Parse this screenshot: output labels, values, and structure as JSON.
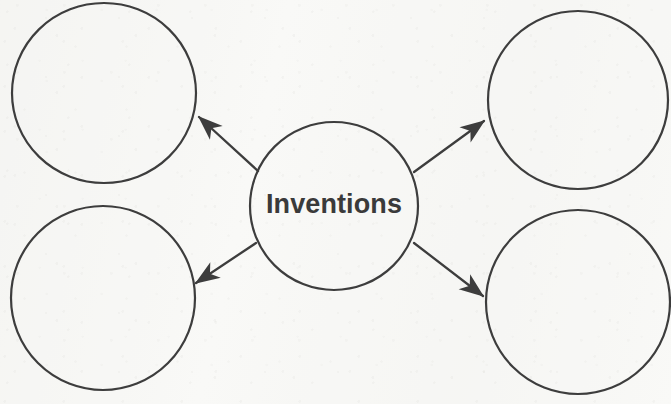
{
  "diagram": {
    "type": "concept-map",
    "title": "Inventions",
    "canvas": {
      "width": 671,
      "height": 404
    },
    "style": {
      "background_color": "#f9f9f7",
      "stroke_color": "#3d3d3d",
      "stroke_width": 2.2,
      "label_color": "#3a3a3a",
      "label_font_size": 27
    },
    "center_node": {
      "label": "Inventions",
      "cx": 334,
      "cy": 206,
      "rx": 84,
      "ry": 84
    },
    "branch_nodes": [
      {
        "name": "top-left-blank-node",
        "label": "",
        "cx": 104,
        "cy": 93,
        "rx": 92,
        "ry": 90
      },
      {
        "name": "top-right-blank-node",
        "label": "",
        "cx": 578,
        "cy": 100,
        "rx": 90,
        "ry": 89
      },
      {
        "name": "bottom-left-blank-node",
        "label": "",
        "cx": 103,
        "cy": 298,
        "rx": 92,
        "ry": 92
      },
      {
        "name": "bottom-right-blank-node",
        "label": "",
        "cx": 578,
        "cy": 302,
        "rx": 92,
        "ry": 92
      }
    ],
    "connectors": [
      {
        "name": "arrow-to-top-left",
        "from_x": 258,
        "from_y": 171,
        "to_x": 199,
        "to_y": 117
      },
      {
        "name": "arrow-to-top-right",
        "from_x": 414,
        "from_y": 172,
        "to_x": 484,
        "to_y": 121
      },
      {
        "name": "arrow-to-bottom-left",
        "from_x": 256,
        "from_y": 243,
        "to_x": 196,
        "to_y": 283
      },
      {
        "name": "arrow-to-bottom-right",
        "from_x": 414,
        "from_y": 243,
        "to_x": 483,
        "to_y": 296
      }
    ]
  }
}
